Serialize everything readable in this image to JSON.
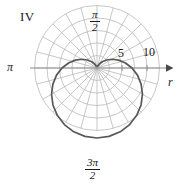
{
  "figure": {
    "number": "IV",
    "type": "polar-plot"
  },
  "labels": {
    "angle_top_num": "π",
    "angle_top_den": "2",
    "angle_left": "π",
    "angle_bottom_num": "3π",
    "angle_bottom_den": "2",
    "axis_r": "r"
  },
  "ticks": {
    "values": [
      "5",
      "10"
    ]
  },
  "colors": {
    "grid": "#b9b9b9",
    "axis": "#8f8f8f",
    "curve": "#585858",
    "text": "#1a1a1a",
    "background": "#ffffff"
  },
  "chart_data": {
    "type": "line",
    "coordinate_system": "polar",
    "title": "IV",
    "xlabel": "r",
    "ylabel": "",
    "angle_tick_labels": [
      "π/2",
      "π",
      "3π/2"
    ],
    "radial_tick_labels": [
      "5",
      "10"
    ],
    "radial_ticks": [
      5,
      10
    ],
    "rlim": [
      0,
      12.5
    ],
    "grid": true,
    "legend": "none",
    "grid_circles_r": [
      2.5,
      5,
      7.5,
      10,
      12.5
    ],
    "grid_rays_deg": [
      0,
      15,
      30,
      45,
      60,
      75,
      90,
      105,
      120,
      135,
      150,
      165,
      180,
      195,
      210,
      225,
      240,
      255,
      270,
      285,
      300,
      315,
      330,
      345
    ],
    "series": [
      {
        "name": "cardioid",
        "equation": "r = 7(1 - sinθ)",
        "theta_deg": [
          90,
          100,
          110,
          120,
          130,
          140,
          150,
          160,
          170,
          180,
          190,
          200,
          210,
          220,
          230,
          240,
          250,
          260,
          270,
          280,
          290,
          300,
          310,
          320,
          330,
          340,
          350,
          360,
          370,
          380,
          390,
          400,
          410,
          420,
          430,
          440,
          450
        ],
        "r": [
          0.0,
          0.11,
          0.42,
          0.94,
          1.64,
          2.5,
          3.5,
          4.61,
          5.78,
          7.0,
          8.22,
          9.39,
          10.5,
          11.5,
          12.36,
          13.06,
          13.58,
          13.89,
          14.0,
          13.89,
          13.58,
          13.06,
          12.36,
          11.5,
          10.5,
          9.39,
          8.22,
          7.0,
          5.78,
          4.61,
          3.5,
          2.5,
          1.64,
          0.94,
          0.42,
          0.11,
          0.0
        ]
      }
    ]
  }
}
